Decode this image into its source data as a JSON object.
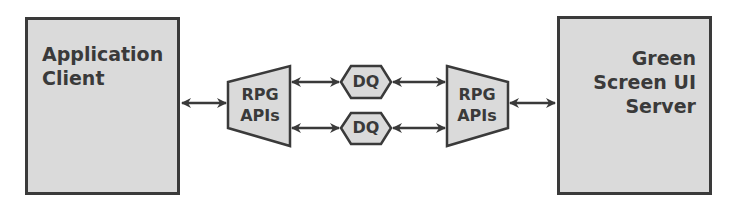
{
  "diagram": {
    "left_node": {
      "lines": [
        "Application",
        "Client"
      ]
    },
    "right_node": {
      "lines": [
        "Green",
        "Screen UI",
        "Server"
      ]
    },
    "left_api": {
      "lines": [
        "RPG",
        "APIs"
      ]
    },
    "right_api": {
      "lines": [
        "RPG",
        "APIs"
      ]
    },
    "queues": [
      {
        "label": "DQ"
      },
      {
        "label": "DQ"
      }
    ],
    "colors": {
      "fill": "#dadada",
      "stroke": "#3a3a3a",
      "text": "#3a3a3a"
    }
  }
}
